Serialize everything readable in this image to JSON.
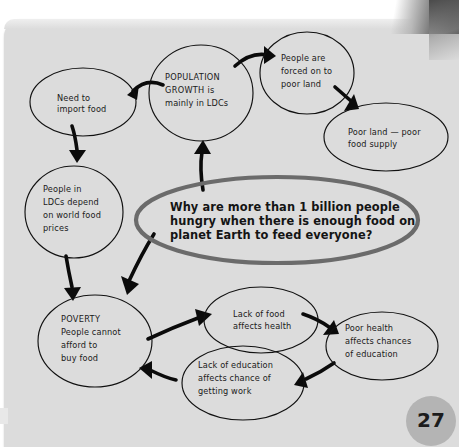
{
  "page": {
    "number": "27",
    "panel_color": "#dcdcdc",
    "ink_color": "#111111",
    "highlight_color": "#6b6b6b"
  },
  "diagram": {
    "type": "concept-map",
    "central_question": {
      "lines": [
        "Why are more than 1 billion people",
        "hungry when there is enough food on",
        "planet Earth to feed everyone?"
      ],
      "text": "Why are more than 1 billion people hungry when there is enough food on planet Earth to feed everyone?"
    },
    "nodes": [
      {
        "id": "need-to-import-food",
        "lines": [
          "Need to",
          "import food"
        ],
        "text": "Need to import food"
      },
      {
        "id": "population-growth",
        "lines": [
          "POPULATION",
          "GROWTH is",
          "mainly in LDCs"
        ],
        "text": "POPULATION GROWTH is mainly in LDCs"
      },
      {
        "id": "people-forced-on-to-poor-land",
        "lines": [
          "People are",
          "forced on to",
          "poor land"
        ],
        "text": "People are forced on to poor land"
      },
      {
        "id": "poor-land-poor-food-supply",
        "lines": [
          "Poor land — poor",
          "food supply"
        ],
        "text": "Poor land — poor food supply"
      },
      {
        "id": "people-in-ldcs-depend-on-world-food-prices",
        "lines": [
          "People in",
          "LDCs depend",
          "on world food",
          "prices"
        ],
        "text": "People in LDCs depend on world food prices"
      },
      {
        "id": "poverty",
        "lines": [
          "POVERTY",
          "People cannot",
          "afford to",
          "buy food"
        ],
        "text": "POVERTY People cannot afford to buy food"
      },
      {
        "id": "lack-of-food-affects-health",
        "lines": [
          "Lack of food",
          "affects health"
        ],
        "text": "Lack of food affects health"
      },
      {
        "id": "poor-health-affects-chances-of-education",
        "lines": [
          "Poor health",
          "affects chances",
          "of education"
        ],
        "text": "Poor health affects chances of education"
      },
      {
        "id": "lack-of-education-affects-chance-of-getting-work",
        "lines": [
          "Lack of education",
          "affects chance of",
          "getting work"
        ],
        "text": "Lack of education affects chance of getting work"
      }
    ],
    "edges": [
      {
        "from": "central-question",
        "to": "population-growth"
      },
      {
        "from": "population-growth",
        "to": "need-to-import-food"
      },
      {
        "from": "population-growth",
        "to": "people-forced-on-to-poor-land"
      },
      {
        "from": "people-forced-on-to-poor-land",
        "to": "poor-land-poor-food-supply"
      },
      {
        "from": "need-to-import-food",
        "to": "people-in-ldcs-depend-on-world-food-prices"
      },
      {
        "from": "people-in-ldcs-depend-on-world-food-prices",
        "to": "poverty"
      },
      {
        "from": "central-question",
        "to": "poverty"
      },
      {
        "from": "poverty",
        "to": "lack-of-food-affects-health"
      },
      {
        "from": "lack-of-food-affects-health",
        "to": "poor-health-affects-chances-of-education"
      },
      {
        "from": "poor-health-affects-chances-of-education",
        "to": "lack-of-education-affects-chance-of-getting-work"
      },
      {
        "from": "lack-of-education-affects-chance-of-getting-work",
        "to": "poverty"
      }
    ]
  }
}
